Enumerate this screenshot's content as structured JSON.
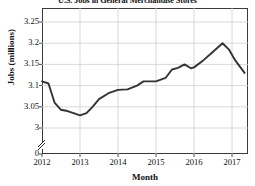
{
  "chart_data": {
    "type": "line",
    "title": "U.S. Jobs in General Merchandise Stores",
    "xlabel": "Month",
    "ylabel": "Jobs (millions)",
    "grid": true,
    "legend": "none",
    "axis_break": true,
    "axis_break_note": "y-axis broken between 0 and 3",
    "xlim": [
      2012,
      2017.42
    ],
    "ylim": [
      3.0,
      3.27
    ],
    "yticks": [
      "0",
      "3",
      "3.05",
      "3.1",
      "3.15",
      "3.2",
      "3.25"
    ],
    "ytick_values": [
      0,
      3,
      3.05,
      3.1,
      3.15,
      3.2,
      3.25
    ],
    "xticks": [
      "2012",
      "2013",
      "2014",
      "2015",
      "2016",
      "2017"
    ],
    "xtick_values": [
      2012,
      2013,
      2014,
      2015,
      2016,
      2017
    ],
    "series": [
      {
        "name": "Jobs in general merchandise stores",
        "color": "#333333",
        "x": [
          2012.0,
          2012.17,
          2012.33,
          2012.5,
          2012.67,
          2012.83,
          2013.0,
          2013.17,
          2013.33,
          2013.5,
          2013.75,
          2014.0,
          2014.25,
          2014.5,
          2014.67,
          2014.83,
          2015.0,
          2015.25,
          2015.42,
          2015.58,
          2015.75,
          2015.92,
          2016.0,
          2016.25,
          2016.5,
          2016.75,
          2016.92,
          2017.08,
          2017.33
        ],
        "y": [
          3.11,
          3.105,
          3.06,
          3.043,
          3.04,
          3.035,
          3.03,
          3.035,
          3.05,
          3.068,
          3.082,
          3.09,
          3.091,
          3.1,
          3.11,
          3.11,
          3.11,
          3.118,
          3.138,
          3.142,
          3.15,
          3.141,
          3.143,
          3.16,
          3.18,
          3.2,
          3.185,
          3.16,
          3.13
        ]
      }
    ]
  }
}
